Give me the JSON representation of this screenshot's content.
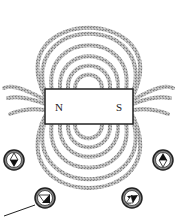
{
  "diagram": {
    "magnet": {
      "north_label": "N",
      "south_label": "S",
      "x": 45,
      "y": 89,
      "width": 88,
      "height": 35,
      "fill": "#ffffff",
      "stroke": "#222222"
    },
    "field_line_color": "#9a9a9a",
    "compasses": [
      {
        "id": "left",
        "cx": 14,
        "cy": 160,
        "needle": "north-up-dark-bottom"
      },
      {
        "id": "right",
        "cx": 163,
        "cy": 160,
        "needle": "dark-top-white-bottom"
      },
      {
        "id": "bottom-left",
        "cx": 45,
        "cy": 198,
        "needle": "white-left-dark-right"
      },
      {
        "id": "bottom-right",
        "cx": 132,
        "cy": 198,
        "needle": "white-left-dark-right"
      }
    ],
    "pointer_arrow": {
      "from": [
        4,
        216
      ],
      "to": [
        36,
        205
      ]
    }
  }
}
